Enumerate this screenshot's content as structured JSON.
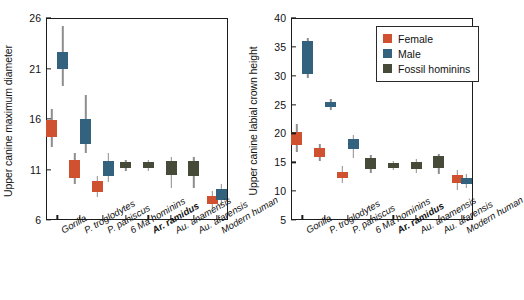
{
  "figure": {
    "categories": [
      "Gorilla",
      "P. troglodytes",
      "P. paniscus",
      "6 Ma hominins",
      "Ar. ramidus",
      "Au. anamensis",
      "Au. afarensis",
      "Modern human"
    ],
    "bold_category": "Ar. ramidus",
    "colors": {
      "female": "#cf5130",
      "male": "#33627f",
      "fossil": "#464a38",
      "whisker": "#8e8e8e",
      "axis": "#1c1c1c"
    }
  },
  "legend": {
    "items": [
      {
        "label": "Female",
        "color": "#cf5130",
        "key": "female"
      },
      {
        "label": "Male",
        "color": "#33627f",
        "key": "male"
      },
      {
        "label": "Fossil hominins",
        "color": "#464a38",
        "key": "fossil"
      }
    ]
  },
  "chart_data": [
    {
      "type": "box",
      "panel": "left",
      "title": "",
      "xlabel": "",
      "ylabel": "Upper canine maximum diameter",
      "ylim": [
        6,
        26
      ],
      "yticks": [
        6,
        11,
        16,
        21,
        26
      ],
      "grid": false,
      "categories": [
        "Gorilla",
        "P. troglodytes",
        "P. paniscus",
        "6 Ma hominins",
        "Ar. ramidus",
        "Au. anamensis",
        "Au. afarensis",
        "Modern human"
      ],
      "series": [
        {
          "name": "Female",
          "group": "female",
          "boxes": [
            {
              "category": "Gorilla",
              "whisker_low": 13.2,
              "q1": 14.2,
              "median": 15.0,
              "q3": 15.9,
              "whisker_high": 17.0
            },
            {
              "category": "P. troglodytes",
              "whisker_low": 9.6,
              "q1": 10.2,
              "median": 11.1,
              "q3": 11.9,
              "whisker_high": 12.6
            },
            {
              "category": "P. paniscus",
              "whisker_low": 8.3,
              "q1": 8.8,
              "median": 9.4,
              "q3": 9.9,
              "whisker_high": 10.4
            },
            {
              "category": "Modern human",
              "whisker_low": 7.2,
              "q1": 7.6,
              "median": 8.0,
              "q3": 8.4,
              "whisker_high": 8.9
            }
          ]
        },
        {
          "name": "Male",
          "group": "male",
          "boxes": [
            {
              "category": "Gorilla",
              "whisker_low": 19.3,
              "q1": 20.9,
              "median": 21.4,
              "q3": 22.6,
              "whisker_high": 25.2
            },
            {
              "category": "P. troglodytes",
              "whisker_low": 12.6,
              "q1": 13.5,
              "median": 14.3,
              "q3": 16.0,
              "whisker_high": 18.4
            },
            {
              "category": "P. paniscus",
              "whisker_low": 9.8,
              "q1": 10.4,
              "median": 11.2,
              "q3": 11.8,
              "whisker_high": 12.6
            },
            {
              "category": "Modern human",
              "whisker_low": 7.4,
              "q1": 8.0,
              "median": 8.4,
              "q3": 9.1,
              "whisker_high": 9.6
            }
          ]
        },
        {
          "name": "Fossil hominins",
          "group": "fossil",
          "boxes": [
            {
              "category": "6 Ma hominins",
              "whisker_low": 10.9,
              "q1": 11.1,
              "median": 11.4,
              "q3": 11.7,
              "whisker_high": 11.9
            },
            {
              "category": "Ar. ramidus",
              "whisker_low": 10.9,
              "q1": 11.1,
              "median": 11.4,
              "q3": 11.7,
              "whisker_high": 11.9
            },
            {
              "category": "Au. anamensis",
              "whisker_low": 9.2,
              "q1": 10.5,
              "median": 11.1,
              "q3": 11.8,
              "whisker_high": 12.2
            },
            {
              "category": "Au. afarensis",
              "whisker_low": 9.2,
              "q1": 10.4,
              "median": 11.0,
              "q3": 11.8,
              "whisker_high": 12.2
            }
          ]
        }
      ]
    },
    {
      "type": "box",
      "panel": "right",
      "title": "",
      "xlabel": "",
      "ylabel": "Upper canine labial crown height",
      "ylim": [
        5,
        40
      ],
      "yticks": [
        5,
        10,
        15,
        20,
        25,
        30,
        35,
        40
      ],
      "grid": false,
      "categories": [
        "Gorilla",
        "P. troglodytes",
        "P. paniscus",
        "6 Ma hominins",
        "Ar. ramidus",
        "Au. anamensis",
        "Au. afarensis",
        "Modern human"
      ],
      "series": [
        {
          "name": "Female",
          "group": "female",
          "boxes": [
            {
              "category": "Gorilla",
              "whisker_low": 16.8,
              "q1": 18.0,
              "median": 19.0,
              "q3": 20.2,
              "whisker_high": 21.6
            },
            {
              "category": "P. troglodytes",
              "whisker_low": 15.2,
              "q1": 16.0,
              "median": 16.7,
              "q3": 17.4,
              "whisker_high": 18.2
            },
            {
              "category": "P. paniscus",
              "whisker_low": 11.4,
              "q1": 12.2,
              "median": 12.7,
              "q3": 13.4,
              "whisker_high": 14.4
            },
            {
              "category": "Modern human",
              "whisker_low": 10.2,
              "q1": 11.4,
              "median": 12.0,
              "q3": 12.8,
              "whisker_high": 13.6
            }
          ]
        },
        {
          "name": "Male",
          "group": "male",
          "boxes": [
            {
              "category": "Gorilla",
              "whisker_low": 29.6,
              "q1": 30.3,
              "median": 35.5,
              "q3": 36.0,
              "whisker_high": 36.6
            },
            {
              "category": "P. troglodytes",
              "whisker_low": 24.0,
              "q1": 24.5,
              "median": 25.0,
              "q3": 25.4,
              "whisker_high": 25.9
            },
            {
              "category": "P. paniscus",
              "whisker_low": 15.8,
              "q1": 17.3,
              "median": 18.2,
              "q3": 19.1,
              "whisker_high": 19.7
            },
            {
              "category": "Modern human",
              "whisker_low": 10.6,
              "q1": 11.2,
              "median": 11.6,
              "q3": 12.3,
              "whisker_high": 13.0
            }
          ]
        },
        {
          "name": "Fossil hominins",
          "group": "fossil",
          "boxes": [
            {
              "category": "6 Ma hominins",
              "whisker_low": 13.2,
              "q1": 13.9,
              "median": 14.6,
              "q3": 15.7,
              "whisker_high": 16.2
            },
            {
              "category": "Ar. ramidus",
              "whisker_low": 13.6,
              "q1": 14.0,
              "median": 14.4,
              "q3": 14.9,
              "whisker_high": 15.2
            },
            {
              "category": "Au. anamensis",
              "whisker_low": 13.2,
              "q1": 13.9,
              "median": 14.4,
              "q3": 15.1,
              "whisker_high": 15.6
            },
            {
              "category": "Au. afarensis",
              "whisker_low": 12.9,
              "q1": 14.0,
              "median": 15.1,
              "q3": 16.1,
              "whisker_high": 16.5
            }
          ]
        }
      ]
    }
  ]
}
